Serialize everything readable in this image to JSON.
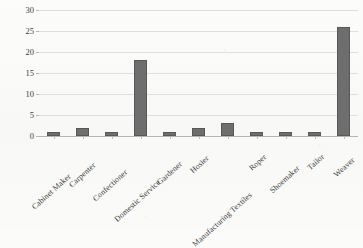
{
  "chart_data": {
    "type": "bar",
    "title": "",
    "xlabel": "",
    "ylabel": "Number of Children",
    "categories": [
      "Cabinet Maker",
      "Carpenter",
      "Confectioner",
      "Domestic Service",
      "Gardener",
      "Hosier",
      "Manufacturing Textiles",
      "Roper",
      "Shoemaker",
      "Tailor",
      "Weaver"
    ],
    "values": [
      1,
      2,
      1,
      18,
      1,
      2,
      3,
      1,
      1,
      1,
      26
    ],
    "ylim": [
      0,
      30
    ],
    "yticks": [
      0,
      5,
      10,
      15,
      20,
      25,
      30
    ],
    "ytick_labels": [
      "0",
      "5",
      "10",
      "15",
      "20",
      "25",
      "30"
    ],
    "grid": true,
    "legend": false,
    "legend_position": "none",
    "bar_color": "#6e6e6e",
    "gridline_color": "#dedede",
    "background_color": "#fbfbfa"
  },
  "caption": {
    "partial_text": ""
  }
}
